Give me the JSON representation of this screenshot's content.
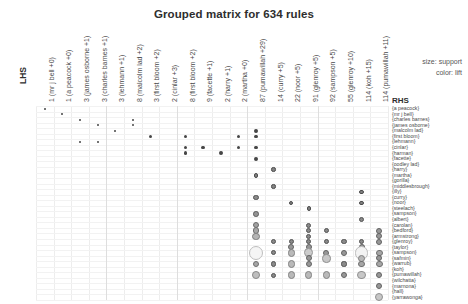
{
  "title": "Grouped matrix for 634 rules",
  "axis": {
    "lhs_label": "LHS",
    "rhs_label": "RHS"
  },
  "legend": {
    "size_line": "size: support",
    "color_line": "color: lift"
  },
  "chart_data": {
    "type": "scatter",
    "title": "Grouped matrix for 634 rules",
    "xlabel": "LHS",
    "ylabel": "RHS",
    "size_encodes": "support",
    "color_encodes": "lift",
    "grid": true,
    "legend_position": "top-right",
    "categories_x": [
      "1 (mr j bell +0)",
      "1 (a peacock +0)",
      "3 (james osborne +1)",
      "3 (charles barnes +1)",
      "3 (lehmann +1)",
      "8 (malcolm lad +2)",
      "3 (first bloom +2)",
      "2 (cinlar +3)",
      "8 (first bloom +2)",
      "9 (facette +1)",
      "2 (harry +1)",
      "2 (martha +0)",
      "87 (pumawillah +29)",
      "14 (curry +5)",
      "22 (noor +5)",
      "91 (glenroy +5)",
      "92 (sampson +5)",
      "55 (glenroy +10)",
      "114 (koh +15)",
      "114 (pumawillah +11)"
    ],
    "categories_y": [
      "{a peacock}",
      "{mr j bell}",
      "{charles barnes}",
      "{james osborne}",
      "{malcolm lad}",
      "{first bloom}",
      "{lehmann}",
      "{cinlar}",
      "{harman}",
      "{facette}",
      "{oodley lad}",
      "{harry}",
      "{martha}",
      "{gorilla}",
      "{middlesbrough}",
      "{illy}",
      "{curry}",
      "{noor}",
      "{steelach}",
      "{sampson}",
      "{albert}",
      "{carolan}",
      "{bedford}",
      "{armstrong}",
      "{glenroy}",
      "{taylor}",
      "{sampson}",
      "{safmin}",
      "{warrub}",
      "{koh}",
      "{pumawillah}",
      "{wilchatta}",
      "{marnona}",
      "{hall}",
      "{yarrawonga}"
    ],
    "points": [
      {
        "col": 0,
        "row": 0,
        "support": 0.09,
        "lift": 0.95
      },
      {
        "col": 1,
        "row": 1,
        "support": 0.09,
        "lift": 0.95
      },
      {
        "col": 2,
        "row": 2,
        "support": 0.09,
        "lift": 0.95
      },
      {
        "col": 3,
        "row": 3,
        "support": 0.09,
        "lift": 0.95
      },
      {
        "col": 2,
        "row": 6,
        "support": 0.09,
        "lift": 0.95
      },
      {
        "col": 3,
        "row": 6,
        "support": 0.09,
        "lift": 0.95
      },
      {
        "col": 5,
        "row": 2,
        "support": 0.09,
        "lift": 0.95
      },
      {
        "col": 5,
        "row": 3,
        "support": 0.09,
        "lift": 0.95
      },
      {
        "col": 4,
        "row": 4,
        "support": 0.09,
        "lift": 0.95
      },
      {
        "col": 6,
        "row": 5,
        "support": 0.1,
        "lift": 0.95
      },
      {
        "col": 8,
        "row": 5,
        "support": 0.1,
        "lift": 0.95
      },
      {
        "col": 8,
        "row": 7,
        "support": 0.1,
        "lift": 0.95
      },
      {
        "col": 8,
        "row": 8,
        "support": 0.1,
        "lift": 0.95
      },
      {
        "col": 9,
        "row": 7,
        "support": 0.1,
        "lift": 0.95
      },
      {
        "col": 10,
        "row": 8,
        "support": 0.1,
        "lift": 0.95
      },
      {
        "col": 11,
        "row": 7,
        "support": 0.1,
        "lift": 0.95
      },
      {
        "col": 11,
        "row": 5,
        "support": 0.1,
        "lift": 0.95
      },
      {
        "col": 12,
        "row": 4,
        "support": 0.1,
        "lift": 0.95
      },
      {
        "col": 12,
        "row": 5,
        "support": 0.1,
        "lift": 0.95
      },
      {
        "col": 12,
        "row": 7,
        "support": 0.1,
        "lift": 0.95
      },
      {
        "col": 12,
        "row": 9,
        "support": 0.1,
        "lift": 0.95
      },
      {
        "col": 13,
        "row": 11,
        "support": 0.11,
        "lift": 0.93
      },
      {
        "col": 12,
        "row": 12,
        "support": 0.11,
        "lift": 0.93
      },
      {
        "col": 13,
        "row": 14,
        "support": 0.11,
        "lift": 0.93
      },
      {
        "col": 12,
        "row": 16,
        "support": 0.12,
        "lift": 0.9
      },
      {
        "col": 14,
        "row": 17,
        "support": 0.11,
        "lift": 0.93
      },
      {
        "col": 15,
        "row": 18,
        "support": 0.11,
        "lift": 0.93
      },
      {
        "col": 18,
        "row": 15,
        "support": 0.11,
        "lift": 0.93
      },
      {
        "col": 18,
        "row": 17,
        "support": 0.11,
        "lift": 0.93
      },
      {
        "col": 12,
        "row": 19,
        "support": 0.13,
        "lift": 0.86
      },
      {
        "col": 12,
        "row": 21,
        "support": 0.15,
        "lift": 0.8
      },
      {
        "col": 12,
        "row": 22,
        "support": 0.16,
        "lift": 0.78
      },
      {
        "col": 12,
        "row": 23,
        "support": 0.18,
        "lift": 0.72
      },
      {
        "col": 12,
        "row": 26,
        "support": 0.55,
        "lift": 0.45
      },
      {
        "col": 12,
        "row": 28,
        "support": 0.16,
        "lift": 0.78
      },
      {
        "col": 12,
        "row": 30,
        "support": 0.2,
        "lift": 0.68
      },
      {
        "col": 13,
        "row": 24,
        "support": 0.12,
        "lift": 0.9
      },
      {
        "col": 13,
        "row": 26,
        "support": 0.12,
        "lift": 0.9
      },
      {
        "col": 13,
        "row": 28,
        "support": 0.12,
        "lift": 0.9
      },
      {
        "col": 13,
        "row": 30,
        "support": 0.12,
        "lift": 0.9
      },
      {
        "col": 14,
        "row": 24,
        "support": 0.12,
        "lift": 0.9
      },
      {
        "col": 14,
        "row": 25,
        "support": 0.14,
        "lift": 0.84
      },
      {
        "col": 14,
        "row": 26,
        "support": 0.18,
        "lift": 0.7
      },
      {
        "col": 14,
        "row": 28,
        "support": 0.18,
        "lift": 0.7
      },
      {
        "col": 14,
        "row": 30,
        "support": 0.18,
        "lift": 0.7
      },
      {
        "col": 15,
        "row": 21,
        "support": 0.12,
        "lift": 0.9
      },
      {
        "col": 15,
        "row": 22,
        "support": 0.12,
        "lift": 0.9
      },
      {
        "col": 15,
        "row": 23,
        "support": 0.12,
        "lift": 0.9
      },
      {
        "col": 15,
        "row": 24,
        "support": 0.12,
        "lift": 0.9
      },
      {
        "col": 15,
        "row": 25,
        "support": 0.14,
        "lift": 0.84
      },
      {
        "col": 15,
        "row": 26,
        "support": 0.24,
        "lift": 0.62
      },
      {
        "col": 15,
        "row": 27,
        "support": 0.14,
        "lift": 0.84
      },
      {
        "col": 15,
        "row": 28,
        "support": 0.14,
        "lift": 0.84
      },
      {
        "col": 15,
        "row": 30,
        "support": 0.18,
        "lift": 0.7
      },
      {
        "col": 16,
        "row": 22,
        "support": 0.12,
        "lift": 0.9
      },
      {
        "col": 16,
        "row": 24,
        "support": 0.12,
        "lift": 0.9
      },
      {
        "col": 16,
        "row": 26,
        "support": 0.14,
        "lift": 0.84
      },
      {
        "col": 16,
        "row": 27,
        "support": 0.22,
        "lift": 0.64
      },
      {
        "col": 16,
        "row": 30,
        "support": 0.18,
        "lift": 0.7
      },
      {
        "col": 17,
        "row": 24,
        "support": 0.12,
        "lift": 0.9
      },
      {
        "col": 17,
        "row": 26,
        "support": 0.14,
        "lift": 0.84
      },
      {
        "col": 17,
        "row": 28,
        "support": 0.12,
        "lift": 0.9
      },
      {
        "col": 17,
        "row": 30,
        "support": 0.14,
        "lift": 0.84
      },
      {
        "col": 18,
        "row": 20,
        "support": 0.12,
        "lift": 0.9
      },
      {
        "col": 18,
        "row": 24,
        "support": 0.12,
        "lift": 0.9
      },
      {
        "col": 18,
        "row": 25,
        "support": 0.14,
        "lift": 0.84
      },
      {
        "col": 18,
        "row": 26,
        "support": 0.52,
        "lift": 0.46
      },
      {
        "col": 18,
        "row": 27,
        "support": 0.18,
        "lift": 0.7
      },
      {
        "col": 18,
        "row": 28,
        "support": 0.16,
        "lift": 0.78
      },
      {
        "col": 18,
        "row": 30,
        "support": 0.22,
        "lift": 0.64
      },
      {
        "col": 19,
        "row": 22,
        "support": 0.14,
        "lift": 0.84
      },
      {
        "col": 19,
        "row": 23,
        "support": 0.14,
        "lift": 0.84
      },
      {
        "col": 19,
        "row": 24,
        "support": 0.14,
        "lift": 0.84
      },
      {
        "col": 19,
        "row": 26,
        "support": 0.16,
        "lift": 0.78
      },
      {
        "col": 19,
        "row": 27,
        "support": 0.14,
        "lift": 0.84
      },
      {
        "col": 19,
        "row": 28,
        "support": 0.16,
        "lift": 0.78
      },
      {
        "col": 19,
        "row": 30,
        "support": 0.14,
        "lift": 0.84
      },
      {
        "col": 19,
        "row": 32,
        "support": 0.14,
        "lift": 0.84
      },
      {
        "col": 19,
        "row": 34,
        "support": 0.22,
        "lift": 0.64
      }
    ],
    "group_separators_x": [
      4,
      8,
      12,
      16
    ]
  },
  "geometry": {
    "plot_left": 36,
    "plot_top": 106,
    "plot_right": 388,
    "plot_bottom": 300,
    "col_label_baseline_y": 102,
    "row_label_left": 393,
    "row_label_top": 106
  }
}
